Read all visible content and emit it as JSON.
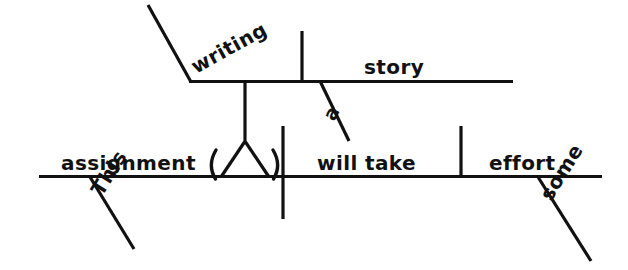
{
  "diagram": {
    "type": "reed-kellogg-sentence-diagram",
    "ink_color": "#111111",
    "background_color": "#ffffff",
    "sentence": "This writing assignment will take some effort.",
    "words": {
      "writing": "writing",
      "story": "story",
      "a": "a",
      "assignment": "assignment",
      "this": "This",
      "will_take": "will take",
      "effort": "effort",
      "some": "some"
    },
    "upper_clause": {
      "subject": "writing",
      "predicate": "story",
      "modifier": "a"
    },
    "main_clause": {
      "subject": "assignment",
      "subject_modifier": "This",
      "predicate": "will take",
      "object": "effort",
      "object_modifier": "some"
    }
  }
}
